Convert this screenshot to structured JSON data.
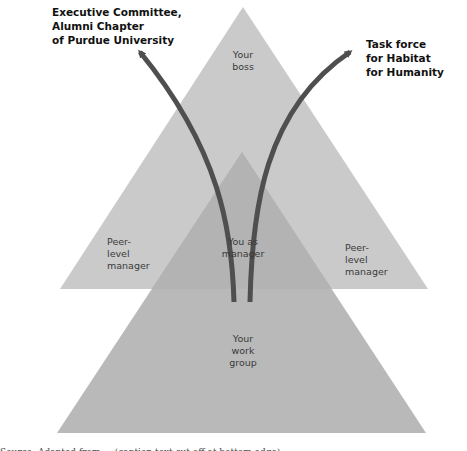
{
  "diagram": {
    "colors": {
      "background": "#ffffff",
      "upper_triangle": "#cacaca",
      "lower_triangle": "#b9b9b9",
      "overlap": "#b3b3b3",
      "arrow": "#4f4f4f",
      "label_text": "#3a3a3a",
      "bold_text": "#111111"
    },
    "triangles": {
      "upper": {
        "apex": [
          243,
          7
        ],
        "base_left": [
          60,
          289
        ],
        "base_right": [
          428,
          289
        ]
      },
      "lower": {
        "apex": [
          242,
          152
        ],
        "base_left": [
          57,
          433
        ],
        "base_right": [
          426,
          433
        ]
      }
    },
    "labels": {
      "your_boss": "Your\nboss",
      "peer_left": "Peer-\nlevel\nmanager",
      "you_as_manager": "You as\nmanager",
      "peer_right": "Peer-\nlevel\nmanager",
      "work_group": "Your\nwork\ngroup"
    },
    "arrow_targets": {
      "left": "Executive Committee,\nAlumni Chapter\nof Purdue University",
      "right": "Task force\nfor Habitat\nfor Humanity"
    },
    "caption_partial": "Source: Adapted from ... (caption text cut off at bottom edge)"
  }
}
